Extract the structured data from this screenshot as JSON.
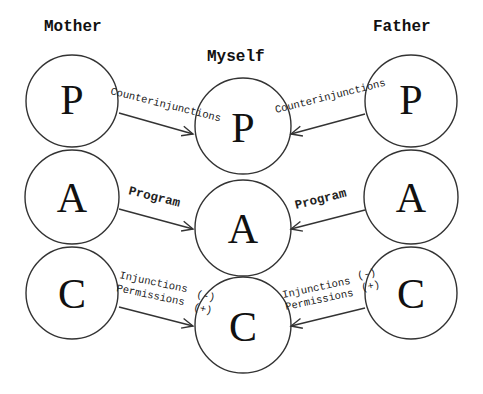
{
  "headings": {
    "mother": "Mother",
    "myself": "Myself",
    "father": "Father"
  },
  "ego_states": {
    "parent": "P",
    "adult": "A",
    "child": "C"
  },
  "arrows": {
    "parent_left": "Counterinjunctions",
    "parent_right": "Counterinjunctions",
    "adult_left": "Program",
    "adult_right": "Program",
    "child_left_line1": "Injunctions",
    "child_left_line2": "Permissions",
    "child_left_neg": "(-)",
    "child_left_pos": "(+)",
    "child_right_line1": "Injunctions",
    "child_right_line2": "Permissions",
    "child_right_neg": "(-)",
    "child_right_pos": "(+)"
  }
}
